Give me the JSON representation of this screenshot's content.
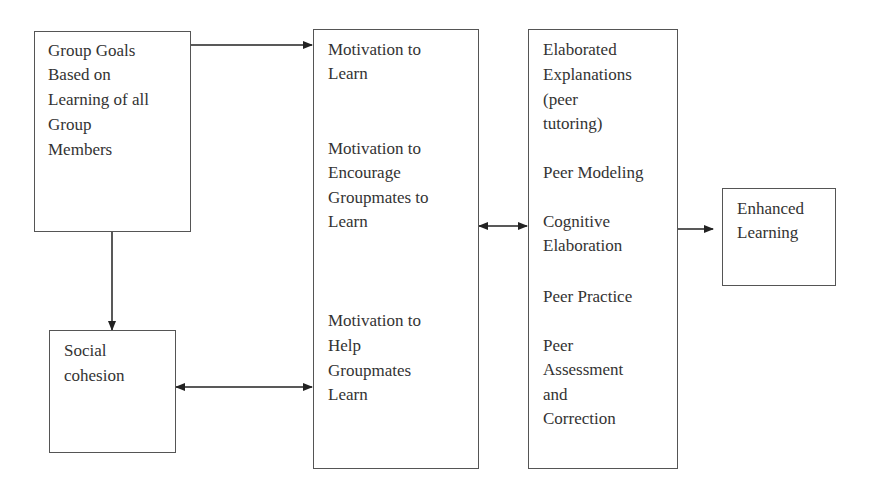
{
  "diagram": {
    "boxes": {
      "group_goals": {
        "lines": [
          "Group Goals",
          "Based on",
          "Learning of all",
          "Group",
          "Members"
        ]
      },
      "motivation": {
        "groups": [
          [
            "Motivation to",
            "Learn"
          ],
          [
            "Motivation to",
            "Encourage",
            "Groupmates to",
            "Learn"
          ],
          [
            "Motivation to",
            "Help",
            "Groupmates",
            "Learn"
          ]
        ]
      },
      "processes": {
        "groups": [
          [
            "Elaborated",
            "Explanations",
            "(peer",
            "tutoring)"
          ],
          [
            "Peer Modeling"
          ],
          [
            "Cognitive",
            "Elaboration"
          ],
          [
            "Peer Practice"
          ],
          [
            "Peer",
            "Assessment",
            "and",
            "Correction"
          ]
        ]
      },
      "enhanced_learning": {
        "lines": [
          "Enhanced",
          "Learning"
        ]
      },
      "social_cohesion": {
        "lines": [
          "Social",
          "cohesion"
        ]
      }
    },
    "edges": [
      {
        "from": "Group Goals Based on Learning of all Group Members",
        "to": "Motivation to Learn",
        "type": "arrow"
      },
      {
        "from": "Group Goals Based on Learning of all Group Members",
        "to": "Social cohesion",
        "type": "arrow"
      },
      {
        "from": "Social cohesion",
        "to": "Motivation to Help Groupmates Learn",
        "type": "bidirectional"
      },
      {
        "from": "Motivation box",
        "to": "Processes box",
        "type": "bidirectional"
      },
      {
        "from": "Processes box",
        "to": "Enhanced Learning",
        "type": "arrow"
      }
    ]
  }
}
